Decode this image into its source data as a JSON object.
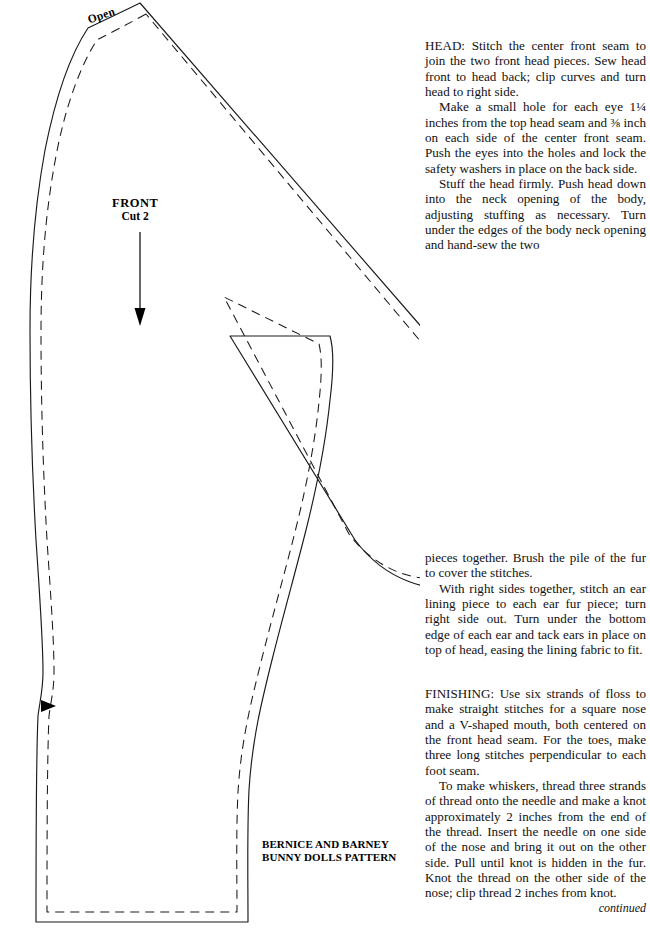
{
  "page": {
    "width": 650,
    "height": 944,
    "background": "#ffffff",
    "ink": "#000000"
  },
  "diagram": {
    "name": "bunny-doll-front-body-sewing-pattern",
    "labels": {
      "open": "Open",
      "front": "FRONT",
      "cut": "Cut 2",
      "title_line1": "BERNICE AND BARNEY",
      "title_line2": "BUNNY DOLLS PATTERN"
    },
    "markings": {
      "grainline_arrow": "downward-arrow",
      "notch": "solid-triangle-notch",
      "cutting_line": "solid",
      "seam_line": "dashed"
    }
  },
  "instructions": {
    "block_one": [
      "HEAD: Stitch the center front seam to join the two front head pieces. Sew head front to head back; clip curves and turn head to right side.",
      "Make a small hole for each eye 1¼ inches from the top head seam and ⅜ inch on each side of the center front seam. Push the eyes into the holes and lock the safety washers in place on the back side.",
      "Stuff the head firmly. Push head down into the neck opening of the body, adjusting stuffing as necessary. Turn under the edges of the body neck opening and hand-sew the two"
    ],
    "block_two": [
      "pieces together. Brush the pile of the fur to cover the stitches.",
      "With right sides together, stitch an ear lining piece to each ear fur piece; turn right side out. Turn under the bottom edge of each ear and tack ears in place on top of head, easing the lining fabric to fit."
    ],
    "block_three": [
      "FINISHING: Use six strands of floss to make straight stitches for a square nose and a V-shaped mouth, both centered on the front head seam. For the toes, make three long stitches perpendicular to each foot seam.",
      "To make whiskers, thread three strands of thread onto the needle and make a knot approximately 2 inches from the end of the thread. Insert the needle on one side of the nose and bring it out on the other side. Pull until knot is hidden in the fur. Knot the thread on the other side of the nose; clip thread 2 inches from knot."
    ],
    "continued": "continued"
  }
}
